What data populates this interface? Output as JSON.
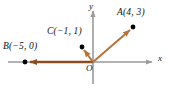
{
  "figure": {
    "name": "vectors-in-coordinate-plane",
    "axes": {
      "x_label": "x",
      "y_label": "y",
      "origin_label": "O",
      "color": "#9a9a9a"
    },
    "vector_color_main": "#b5733c",
    "vector_color_b": "#8a4d22",
    "point_color": "#000000",
    "points": [
      {
        "id": "A",
        "label": "A(4, 3)",
        "x": 4,
        "y": 3,
        "px": 133,
        "py": 27
      },
      {
        "id": "B",
        "label": "B(−5, 0)",
        "x": -5,
        "y": 0,
        "px": 25,
        "py": 62
      },
      {
        "id": "C",
        "label": "C(−1, 1)",
        "x": -1,
        "y": 1,
        "px": 82,
        "py": 47
      }
    ],
    "vectors": [
      {
        "id": "OA",
        "from": "O",
        "to": "A"
      },
      {
        "id": "OB",
        "from": "O",
        "to": "B"
      },
      {
        "id": "OC",
        "from": "O",
        "to": "C"
      }
    ]
  }
}
